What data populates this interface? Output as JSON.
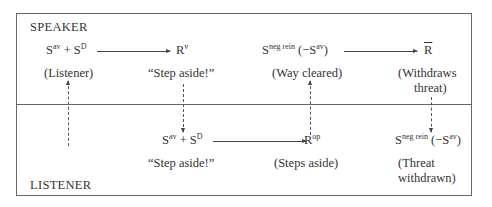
{
  "diagram": {
    "speaker_label": "SPEAKER",
    "listener_label": "LISTENER",
    "speaker_row": {
      "n1": {
        "base": "S",
        "sup": "av",
        "plus": " + ",
        "base2": "S",
        "sup2": "D",
        "caption": "(Listener)"
      },
      "n2": {
        "base": "R",
        "sup": "v",
        "caption": "“Step aside!”"
      },
      "n3": {
        "base": "S",
        "sup": "neg rein",
        "tail": " (−S",
        "tail_sup": "av",
        "tail_end": ")",
        "caption": "(Way cleared)"
      },
      "n4": {
        "base": "R",
        "caption_line1": "(Withdraws",
        "caption_line2": "threat)"
      }
    },
    "listener_row": {
      "n1": {
        "base": "S",
        "sup": "av",
        "plus": " + ",
        "base2": "S",
        "sup2": "D",
        "caption": "“Step aside!”"
      },
      "n2": {
        "base": "R",
        "sup": "op",
        "caption": "(Steps aside)"
      },
      "n3": {
        "base": "S",
        "sup": "neg rein",
        "tail": " (−S",
        "tail_sup": "av",
        "tail_end": ")",
        "caption_line1": "(Threat",
        "caption_line2": "withdrawn)"
      }
    }
  }
}
